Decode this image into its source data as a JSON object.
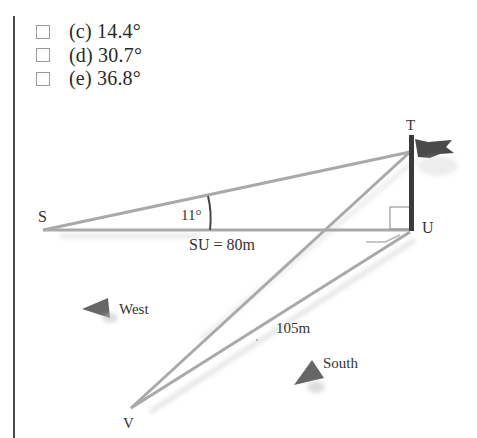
{
  "options": [
    {
      "letter": "(c)",
      "value": "14.4°",
      "label": "(c) 14.4°",
      "checked": false
    },
    {
      "letter": "(d)",
      "value": "30.7°",
      "label": "(d) 30.7°",
      "checked": false
    },
    {
      "letter": "(e)",
      "value": "36.8°",
      "label": "(e) 36.8°",
      "checked": false
    }
  ],
  "diagram": {
    "points": {
      "S": {
        "label": "S"
      },
      "T": {
        "label": "T"
      },
      "U": {
        "label": "U"
      },
      "V": {
        "label": "V"
      }
    },
    "angle_label": "11°",
    "su_label": "SU = 80m",
    "vu_label": "105m",
    "west_label": "West",
    "south_label": "South",
    "colors": {
      "line": "#a9a9a9",
      "pole": "#3a3a3a",
      "arrow": "#6b6b6b",
      "flag": "#4a4a4a"
    }
  }
}
